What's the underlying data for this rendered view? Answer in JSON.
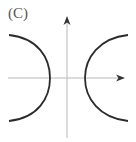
{
  "figure": {
    "label": "(C)",
    "colors": {
      "curve": "#2b2b2b",
      "axis": "#b8b8b8",
      "arrow": "#333333",
      "label": "#555555"
    },
    "axes": {
      "x_axis": {
        "direction": "right",
        "has_arrow": true
      },
      "y_axis": {
        "direction": "up",
        "has_arrow": true
      }
    },
    "curves": [
      {
        "name": "left-branch",
        "opens": "left"
      },
      {
        "name": "right-branch",
        "opens": "right"
      }
    ]
  }
}
